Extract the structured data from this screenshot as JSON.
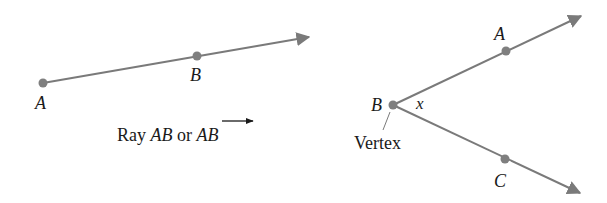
{
  "colors": {
    "line": "#7a7a7a",
    "point": "#7f7f7f",
    "text": "#1a1a1a",
    "background": "#ffffff"
  },
  "ray_figure": {
    "point_a_label": "A",
    "point_b_label": "B",
    "caption_prefix": "Ray ",
    "caption_ab": "AB",
    "caption_or": " or ",
    "caption_ab_notation": "AB"
  },
  "angle_figure": {
    "point_a_label": "A",
    "vertex_label": "B",
    "point_c_label": "C",
    "angle_label": "x",
    "vertex_caption": "Vertex"
  }
}
